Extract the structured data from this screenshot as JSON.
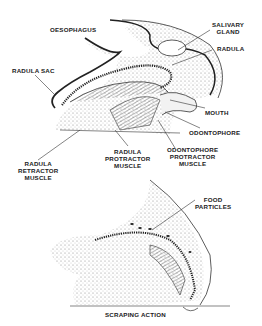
{
  "top_diagram": {
    "labels": {
      "oesophagus": "OESOPHAGUS",
      "salivary_gland_1": "SALIVARY",
      "salivary_gland_2": "GLAND",
      "radula": "RADULA",
      "radula_sac": "RADULA SAC",
      "mouth": "MOUTH",
      "odontophore": "ODONTOPHORE",
      "odontophore_protractor_1": "ODONTOPHORE",
      "odontophore_protractor_2": "PROTRACTOR",
      "odontophore_protractor_3": "MUSCLE",
      "radula_protractor_1": "RADULA",
      "radula_protractor_2": "PROTRACTOR",
      "radula_protractor_3": "MUSCLE",
      "radula_retractor_1": "RADULA",
      "radula_retractor_2": "RETRACTOR",
      "radula_retractor_3": "MUSCLE"
    }
  },
  "bottom_diagram": {
    "labels": {
      "food_particles_1": "FOOD",
      "food_particles_2": "PARTICLES",
      "scraping_action": "SCRAPING ACTION"
    }
  }
}
